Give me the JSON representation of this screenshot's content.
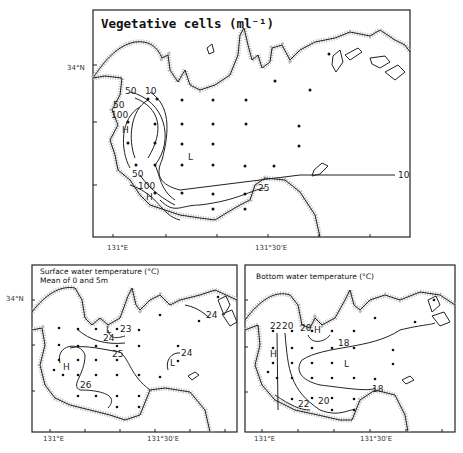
{
  "header_fragment": "...",
  "maps": [
    {
      "id": "vegetative-cells",
      "title": "Vegetative cells (ml⁻¹)",
      "lat_label": "34°N",
      "lon_labels": [
        "131°E",
        "131°30'E"
      ],
      "contour_labels": [
        "10",
        "25",
        "50",
        "100",
        "50",
        "100",
        "25",
        "10"
      ],
      "extrema_labels": [
        "H",
        "H",
        "L"
      ]
    },
    {
      "id": "surface-water-temperature",
      "title": "Surface water temperature (°C)",
      "subtitle": "Mean of 0 and 5m",
      "lat_label": "34°N",
      "lon_labels": [
        "131°E",
        "131°30'E"
      ],
      "contour_labels": [
        "23",
        "24",
        "25",
        "26",
        "24",
        "24"
      ],
      "extrema_labels": [
        "L",
        "H",
        "L"
      ]
    },
    {
      "id": "bottom-water-temperature",
      "title": "Bottom water temperature (°C)",
      "lon_labels": [
        "131°E",
        "131°30'E"
      ],
      "contour_labels": [
        "22",
        "20",
        "20",
        "18",
        "18",
        "20",
        "22"
      ],
      "extrema_labels": [
        "H",
        "H",
        "L"
      ]
    }
  ]
}
